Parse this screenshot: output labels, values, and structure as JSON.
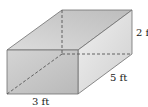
{
  "diagram": {
    "type": "rectangular-prism",
    "labels": {
      "height": "2 ft",
      "depth": "5 ft",
      "width": "3 ft"
    },
    "colors": {
      "edge": "#6e6e6e",
      "hidden_edge": "#555555",
      "front_face": "#c9c9c9",
      "top_face": "#d6d6d6",
      "right_face": "#e2e2e2",
      "label": "#222222"
    }
  }
}
